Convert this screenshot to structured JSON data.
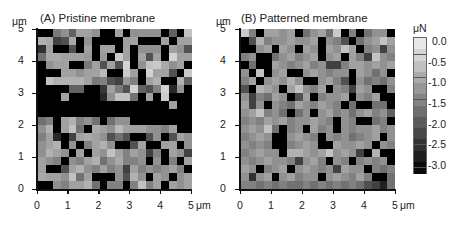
{
  "chart_data": [
    {
      "type": "heatmap",
      "title": "(A) Pristine membrane",
      "xlabel": "μm",
      "ylabel": "μm",
      "x_ticks": [
        "0",
        "1",
        "2",
        "3",
        "4",
        "5"
      ],
      "y_ticks": [
        "0",
        "1",
        "2",
        "3",
        "4",
        "5"
      ],
      "xlim": [
        0,
        5
      ],
      "ylim": [
        0,
        5
      ],
      "grid_size": [
        20,
        20
      ],
      "value_unit": "μN",
      "values_top_to_bottom": [
        [
          -3.0,
          -3.0,
          -1.5,
          -1.2,
          -1.8,
          -1.0,
          -1.0,
          -1.2,
          -3.0,
          -3.0,
          -1.0,
          -3.0,
          -1.2,
          -1.2,
          -1.2,
          -1.2,
          -3.0,
          -1.8,
          -3.0,
          -0.6
        ],
        [
          -0.8,
          -0.9,
          -2.2,
          -2.0,
          -0.9,
          -3.0,
          -1.2,
          -3.0,
          -3.0,
          -3.0,
          -3.0,
          -1.0,
          -1.0,
          -3.0,
          -3.0,
          -3.0,
          -1.0,
          -3.0,
          -1.0,
          -1.0
        ],
        [
          -2.4,
          -1.0,
          -3.0,
          -3.0,
          -2.0,
          -3.0,
          -1.0,
          -3.0,
          -1.0,
          -1.0,
          -3.0,
          -1.0,
          -3.0,
          -1.2,
          -1.2,
          -1.2,
          -3.0,
          -1.0,
          -1.2,
          -2.0
        ],
        [
          -1.6,
          -0.9,
          -0.9,
          -1.0,
          -1.0,
          -1.0,
          -1.1,
          -3.0,
          -1.1,
          -3.0,
          -0.5,
          -1.0,
          -3.0,
          -1.0,
          -2.0,
          -1.0,
          -3.0,
          -0.4,
          -1.0,
          -1.0
        ],
        [
          -3.0,
          -1.2,
          -1.0,
          -1.0,
          -3.0,
          -3.0,
          -1.5,
          -1.0,
          -2.0,
          -1.0,
          -2.0,
          -0.4,
          -3.0,
          -1.2,
          -0.6,
          -0.5,
          -0.9,
          -1.2,
          -1.0,
          -3.0
        ],
        [
          -3.0,
          -3.0,
          -3.0,
          -1.0,
          -1.0,
          -1.2,
          -1.0,
          -1.0,
          -0.7,
          -3.0,
          -3.0,
          -0.5,
          -1.0,
          -3.0,
          -0.4,
          -1.0,
          -1.0,
          -2.0,
          -3.0,
          -0.5
        ],
        [
          -3.0,
          -0.6,
          -0.8,
          -0.8,
          -0.8,
          -0.8,
          -1.0,
          -1.5,
          -1.4,
          -2.0,
          -2.2,
          -1.1,
          -1.4,
          -3.0,
          -1.0,
          -0.8,
          -3.0,
          -3.0,
          -0.8,
          -1.8
        ],
        [
          -3.0,
          -3.0,
          -3.0,
          -3.0,
          -1.8,
          -1.8,
          -3.0,
          -3.0,
          -2.3,
          -1.0,
          -1.5,
          -2.0,
          -0.4,
          -1.8,
          -2.0,
          -1.4,
          -0.4,
          -2.5,
          -1.2,
          -3.0
        ],
        [
          -3.0,
          -3.0,
          -3.0,
          -1.0,
          -3.0,
          -3.0,
          -3.0,
          -3.0,
          -2.5,
          -1.2,
          -0.6,
          -0.6,
          -1.6,
          -3.0,
          -1.0,
          -3.0,
          -0.5,
          -3.0,
          -3.0,
          -3.0
        ],
        [
          -3.0,
          -3.0,
          -3.0,
          -3.0,
          -3.0,
          -3.0,
          -3.0,
          -3.0,
          -3.0,
          -3.0,
          -3.0,
          -3.0,
          -3.0,
          -3.0,
          -3.0,
          -3.0,
          -3.0,
          -1.0,
          -3.0,
          -3.0
        ],
        [
          -3.0,
          -3.0,
          -3.0,
          -3.0,
          -3.0,
          -3.0,
          -3.0,
          -3.0,
          -3.0,
          -3.0,
          -3.0,
          -3.0,
          -3.0,
          -3.0,
          -3.0,
          -3.0,
          -3.0,
          -3.0,
          -3.0,
          -3.0
        ],
        [
          -1.6,
          -1.4,
          -3.0,
          -1.0,
          -0.8,
          -1.4,
          -1.2,
          -1.6,
          -3.0,
          -1.6,
          -1.2,
          -1.2,
          -3.0,
          -3.0,
          -3.0,
          -3.0,
          -3.0,
          -3.0,
          -3.0,
          -3.0
        ],
        [
          -1.2,
          -0.8,
          -3.0,
          -1.0,
          -0.6,
          -1.6,
          -3.0,
          -0.9,
          -1.0,
          -1.2,
          -0.7,
          -1.0,
          -1.0,
          -1.0,
          -1.2,
          -1.2,
          -1.4,
          -1.0,
          -3.0,
          -3.0
        ],
        [
          -1.4,
          -1.0,
          -2.5,
          -3.0,
          -2.2,
          -1.0,
          -0.9,
          -1.0,
          -1.2,
          -2.0,
          -1.6,
          -2.0,
          -3.0,
          -3.0,
          -2.0,
          -1.2,
          -3.0,
          -2.0,
          -1.0,
          -1.2
        ],
        [
          -1.2,
          -1.0,
          -0.8,
          -3.0,
          -1.2,
          -3.0,
          -1.4,
          -1.0,
          -0.8,
          -1.2,
          -3.0,
          -3.0,
          -2.0,
          -1.0,
          -3.0,
          -3.0,
          -1.0,
          -1.0,
          -3.0,
          -1.2
        ],
        [
          -1.2,
          -0.8,
          -1.0,
          -1.2,
          -3.0,
          -1.0,
          -3.0,
          -1.0,
          -1.2,
          -0.6,
          -1.0,
          -1.4,
          -1.0,
          -1.2,
          -2.2,
          -1.4,
          -3.0,
          -1.0,
          -1.2,
          -2.2
        ],
        [
          -1.0,
          -1.2,
          -1.4,
          -3.0,
          -1.2,
          -1.4,
          -1.0,
          -0.8,
          -1.6,
          -1.2,
          -0.9,
          -1.4,
          -1.4,
          -1.2,
          -3.0,
          -1.2,
          -3.0,
          -1.4,
          -3.0,
          -1.0
        ],
        [
          -1.0,
          -3.0,
          -3.0,
          -2.0,
          -1.0,
          -0.8,
          -1.2,
          -1.4,
          -1.0,
          -1.4,
          -1.2,
          -2.2,
          -1.0,
          -1.4,
          -1.2,
          -1.4,
          -1.2,
          -1.0,
          -1.4,
          -3.0
        ],
        [
          -0.9,
          -1.0,
          -1.0,
          -1.2,
          -0.6,
          -1.6,
          -1.0,
          -3.0,
          -3.0,
          -3.0,
          -1.2,
          -2.0,
          -0.8,
          -1.2,
          -3.0,
          -1.0,
          -1.2,
          -3.0,
          -1.2,
          -1.0
        ],
        [
          -3.0,
          -3.0,
          -1.2,
          -1.4,
          -1.0,
          -1.0,
          -0.8,
          -1.6,
          -3.0,
          -1.4,
          -1.4,
          -3.0,
          -1.4,
          -0.6,
          -1.4,
          -1.0,
          -3.0,
          -1.0,
          -1.2,
          -1.0
        ]
      ]
    },
    {
      "type": "heatmap",
      "title": "(B) Patterned membrane",
      "xlabel": "μm",
      "ylabel": "μm",
      "x_ticks": [
        "0",
        "1",
        "2",
        "3",
        "4",
        "5"
      ],
      "y_ticks": [
        "0",
        "1",
        "2",
        "3",
        "4",
        "5"
      ],
      "xlim": [
        0,
        5
      ],
      "ylim": [
        0,
        5
      ],
      "grid_size": [
        20,
        20
      ],
      "value_unit": "μN",
      "values_top_to_bottom": [
        [
          -0.5,
          -1.4,
          -3.0,
          -1.0,
          -1.0,
          -1.2,
          -1.0,
          -3.0,
          -1.6,
          -1.2,
          -1.0,
          -1.6,
          -0.5,
          -3.0,
          -1.4,
          -3.0,
          -1.6,
          -1.2,
          -1.2,
          -3.0
        ],
        [
          -3.0,
          -2.0,
          -0.8,
          -1.4,
          -1.2,
          -1.2,
          -1.0,
          -1.2,
          -1.2,
          -1.0,
          -3.0,
          -1.2,
          -1.4,
          -2.0,
          -3.0,
          -1.6,
          -1.2,
          -1.0,
          -0.6,
          -1.0
        ],
        [
          -3.0,
          -3.0,
          -1.2,
          -1.0,
          -3.0,
          -1.0,
          -1.2,
          -3.0,
          -1.0,
          -1.2,
          -3.0,
          -1.0,
          -1.2,
          -0.6,
          -1.0,
          -3.0,
          -1.4,
          -1.2,
          -2.2,
          -1.2
        ],
        [
          -1.4,
          -1.2,
          -3.0,
          -3.0,
          -1.6,
          -1.2,
          -1.0,
          -1.4,
          -1.2,
          -1.0,
          -3.0,
          -1.2,
          -1.0,
          -3.0,
          -1.0,
          -1.4,
          -2.2,
          -0.6,
          -1.2,
          -1.4
        ],
        [
          -3.0,
          -1.6,
          -3.0,
          -3.0,
          -1.0,
          -1.2,
          -1.4,
          -1.2,
          -1.0,
          -1.4,
          -1.2,
          -2.2,
          -2.2,
          -1.4,
          -1.0,
          -1.0,
          -1.2,
          -1.0,
          -1.2,
          -1.0
        ],
        [
          -1.2,
          -3.0,
          -0.6,
          -3.0,
          -1.2,
          -1.0,
          -3.0,
          -3.0,
          -1.2,
          -1.0,
          -1.2,
          -1.4,
          -1.2,
          -1.2,
          -3.0,
          -1.0,
          -1.2,
          -1.6,
          -1.2,
          -3.0
        ],
        [
          -1.4,
          -1.0,
          -3.0,
          -1.2,
          -1.0,
          -1.2,
          -0.8,
          -1.2,
          -3.0,
          -3.0,
          -1.2,
          -1.0,
          -1.4,
          -2.0,
          -3.0,
          -1.2,
          -1.6,
          -1.4,
          -1.6,
          -1.2
        ],
        [
          -2.0,
          -3.0,
          -0.8,
          -1.0,
          -1.2,
          -3.0,
          -1.0,
          -0.6,
          -1.2,
          -1.4,
          -1.0,
          -3.0,
          -1.2,
          -1.4,
          -2.2,
          -1.0,
          -1.2,
          -3.0,
          -3.0,
          -1.4
        ],
        [
          -1.2,
          -2.2,
          -1.4,
          -1.6,
          -1.0,
          -1.2,
          -3.0,
          -2.0,
          -1.0,
          -3.0,
          -1.4,
          -1.2,
          -1.2,
          -1.0,
          -3.0,
          -1.2,
          -1.4,
          -1.0,
          -3.0,
          -3.0
        ],
        [
          -1.0,
          -2.2,
          -1.2,
          -3.0,
          -1.2,
          -1.4,
          -1.6,
          -1.0,
          -1.2,
          -1.4,
          -1.0,
          -1.2,
          -1.4,
          -3.0,
          -1.6,
          -3.0,
          -3.0,
          -1.6,
          -1.6,
          -3.0
        ],
        [
          -1.2,
          -1.0,
          -0.6,
          -1.4,
          -1.2,
          -1.6,
          -3.0,
          -1.6,
          -1.2,
          -3.0,
          -1.2,
          -1.0,
          -1.4,
          -1.2,
          -1.6,
          -1.2,
          -1.0,
          -1.4,
          -1.2,
          -1.8
        ],
        [
          -1.4,
          -1.2,
          -1.4,
          -1.0,
          -1.2,
          -1.0,
          -1.4,
          -1.2,
          -1.2,
          -1.0,
          -1.2,
          -1.4,
          -3.0,
          -1.2,
          -1.4,
          -3.0,
          -3.0,
          -1.6,
          -1.4,
          -3.0
        ],
        [
          -1.2,
          -1.0,
          -1.2,
          -0.6,
          -1.6,
          -3.0,
          -1.4,
          -1.2,
          -3.0,
          -1.0,
          -1.4,
          -1.2,
          -3.0,
          -1.2,
          -1.4,
          -1.2,
          -1.2,
          -1.0,
          -1.4,
          -1.2
        ],
        [
          -1.4,
          -1.2,
          -1.0,
          -1.2,
          -3.0,
          -3.0,
          -1.2,
          -1.0,
          -1.2,
          -1.4,
          -3.0,
          -1.2,
          -1.4,
          -1.2,
          -1.6,
          -1.4,
          -1.2,
          -1.0,
          -3.0,
          -1.2
        ],
        [
          -1.2,
          -1.4,
          -1.2,
          -1.4,
          -3.0,
          -3.0,
          -1.4,
          -1.2,
          -1.0,
          -1.2,
          -3.0,
          -3.0,
          -1.0,
          -1.2,
          -1.2,
          -1.0,
          -1.2,
          -3.0,
          -1.2,
          -1.4
        ],
        [
          -1.4,
          -1.2,
          -1.0,
          -1.2,
          -1.2,
          -3.0,
          -0.8,
          -0.8,
          -1.0,
          -1.2,
          -1.0,
          -0.6,
          -1.2,
          -1.0,
          -1.2,
          -2.2,
          -3.0,
          -0.8,
          -3.0,
          -3.0
        ],
        [
          -1.2,
          -1.4,
          -1.2,
          -1.0,
          -1.2,
          -1.2,
          -1.4,
          -2.2,
          -1.2,
          -1.0,
          -1.4,
          -3.0,
          -1.2,
          -1.4,
          -3.0,
          -1.4,
          -1.2,
          -1.4,
          -1.2,
          -3.0
        ],
        [
          -1.0,
          -1.2,
          -3.0,
          -1.4,
          -1.2,
          -1.0,
          -3.0,
          -1.2,
          -1.0,
          -1.2,
          -1.4,
          -1.2,
          -2.2,
          -1.0,
          -1.2,
          -1.2,
          -3.0,
          -1.4,
          -1.6,
          -1.4
        ],
        [
          -1.2,
          -2.4,
          -1.2,
          -1.0,
          -3.0,
          -1.2,
          -1.0,
          -1.4,
          -1.2,
          -1.2,
          -3.0,
          -1.2,
          -1.0,
          -1.2,
          -1.4,
          -1.0,
          -1.4,
          -3.0,
          -3.0,
          -1.6
        ],
        [
          -1.4,
          -1.4,
          -1.6,
          -1.4,
          -1.6,
          -1.4,
          -1.6,
          -1.6,
          -1.4,
          -1.6,
          -1.4,
          -1.6,
          -1.4,
          -1.6,
          -1.4,
          -1.6,
          -2.0,
          -2.2,
          -2.6,
          -1.6
        ]
      ]
    }
  ],
  "panels": [
    {
      "title": "(A) Pristine membrane",
      "y_unit": "μm",
      "x_unit": "μm",
      "y_ticks": [
        "5",
        "4",
        "3",
        "2",
        "1",
        "0"
      ],
      "x_ticks": [
        "0",
        "1",
        "2",
        "3",
        "4",
        "5"
      ]
    },
    {
      "title": "(B) Patterned membrane",
      "y_unit": "μm",
      "x_unit": "μm",
      "y_ticks": [
        "5",
        "4",
        "3",
        "2",
        "1",
        "0"
      ],
      "x_ticks": [
        "0",
        "1",
        "2",
        "3",
        "4",
        "5"
      ]
    }
  ],
  "colorbar": {
    "unit": "μN",
    "labels": [
      "0.0",
      "-0.5",
      "-1.0",
      "-1.5",
      "-2.0",
      "-2.5",
      "-3.0"
    ],
    "range": [
      0.0,
      -3.0
    ],
    "color_max": "#ffffff",
    "color_min": "#000000"
  }
}
